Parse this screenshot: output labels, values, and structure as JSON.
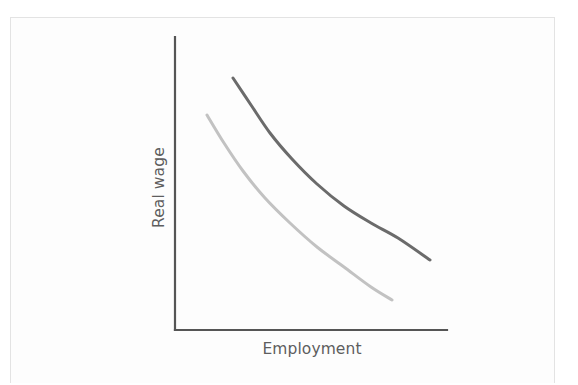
{
  "figure": {
    "background_color": "#fdfdfd",
    "border_color": "#e3e3e3"
  },
  "chart_data": {
    "type": "line",
    "title": "",
    "subtitle": "",
    "xlabel": "Employment",
    "ylabel": "Real wage",
    "grid": false,
    "legend": null,
    "axes": {
      "x_axis_shown": true,
      "y_axis_shown": true,
      "x_ticks": [],
      "y_ticks": [],
      "xlim": [
        0,
        1
      ],
      "ylim": [
        0,
        1
      ],
      "axis_color": "#555555",
      "axis_width_px": 2,
      "origin_px": [
        175,
        330
      ],
      "x_axis_end_px": [
        447,
        330
      ],
      "y_axis_top_px": [
        175,
        37
      ]
    },
    "annotations": [],
    "series": [
      {
        "name": "labour-demand-curve-upper",
        "color": "#6b6b6b",
        "line_width_px": 3,
        "description": "Upper downward-sloping convex curve",
        "x": [
          0.215,
          0.28,
          0.35,
          0.43,
          0.52,
          0.62,
          0.72,
          0.82,
          0.94
        ],
        "y": [
          0.865,
          0.77,
          0.675,
          0.585,
          0.5,
          0.425,
          0.365,
          0.315,
          0.24
        ],
        "points_px": [
          [
            233,
            78
          ],
          [
            251,
            105
          ],
          [
            270,
            133
          ],
          [
            292,
            159
          ],
          [
            317,
            184
          ],
          [
            344,
            206
          ],
          [
            371,
            223
          ],
          [
            398,
            238
          ],
          [
            430,
            260
          ]
        ]
      },
      {
        "name": "labour-demand-curve-lower",
        "color": "#c2c2c2",
        "line_width_px": 3,
        "description": "Lower downward-sloping convex curve, shifted left and down",
        "x": [
          0.118,
          0.18,
          0.25,
          0.33,
          0.42,
          0.52,
          0.62,
          0.72,
          0.8
        ],
        "y": [
          0.735,
          0.645,
          0.555,
          0.465,
          0.385,
          0.305,
          0.24,
          0.185,
          0.145
        ],
        "points_px": [
          [
            207,
            115
          ],
          [
            224,
            143
          ],
          [
            243,
            171
          ],
          [
            265,
            198
          ],
          [
            290,
            223
          ],
          [
            317,
            247
          ],
          [
            344,
            267
          ],
          [
            371,
            287
          ],
          [
            392,
            300
          ]
        ]
      }
    ]
  }
}
